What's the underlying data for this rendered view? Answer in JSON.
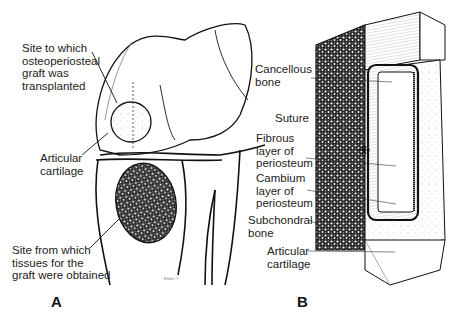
{
  "panel_a": {
    "letter": "A",
    "labels": {
      "graft_site": [
        "Site to which",
        "osteoperiosteal",
        "graft was",
        "transplanted"
      ],
      "articular_cartilage": [
        "Articular",
        "cartilage"
      ],
      "donor_site": [
        "Site from which",
        "tissues for the",
        "graft were obtained"
      ]
    },
    "signature": "Ehlert ©"
  },
  "panel_b": {
    "letter": "B",
    "labels": {
      "cancellous_bone": [
        "Cancellous",
        "bone"
      ],
      "suture": [
        "Suture"
      ],
      "fibrous_layer": [
        "Fibrous",
        "layer of",
        "periosteum"
      ],
      "cambium_layer": [
        "Cambium",
        "layer of",
        "periosteum"
      ],
      "subchondral_bone": [
        "Subchondral",
        "bone"
      ],
      "articular_cartilage": [
        "Articular",
        "cartilage"
      ]
    }
  }
}
